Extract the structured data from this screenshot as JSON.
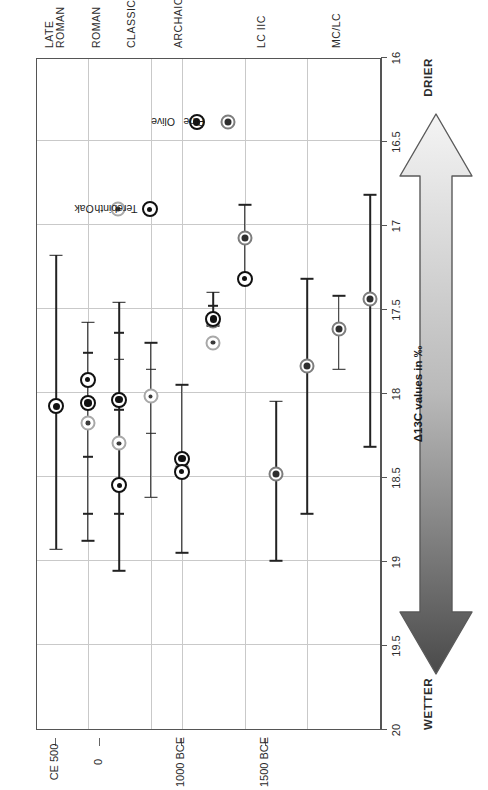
{
  "figure": {
    "orientation": "rotated-90-ccw",
    "background": "#ffffff"
  },
  "moisture_arrow": {
    "left_label": "WETTER",
    "right_label": "DRIER",
    "wet_color": "#4a4a4a",
    "dry_color": "#f2f2f2",
    "stroke": "#555555"
  },
  "axes": {
    "x_title": "Δ13C values in ‰",
    "x_ticks": [
      "20",
      "19.5",
      "19",
      "18.5",
      "18",
      "17.5",
      "17",
      "16.5",
      "16"
    ],
    "x_tick_values": [
      20,
      19.5,
      19,
      18.5,
      18,
      17.5,
      17,
      16.5,
      16
    ],
    "x_min": 20,
    "x_max": 16,
    "date_labels": [
      "CE 500",
      "0",
      "1000 BCE",
      "1500 BCE"
    ],
    "period_labels": [
      "LATE ROMAN",
      "ROMAN",
      "CLASSICAL",
      "ARCHAIC",
      "LC IIC",
      "MC/LC"
    ]
  },
  "legend": {
    "items": [
      {
        "name": "Oak",
        "marker": "oak"
      },
      {
        "name": "Terebinth",
        "marker": "terebinth"
      },
      {
        "name": "Olive",
        "marker": "olive"
      },
      {
        "name": "Pine",
        "marker": "pine"
      }
    ]
  },
  "chart_data": {
    "type": "scatter",
    "title": "",
    "xlabel": "Δ13C values in ‰",
    "ylabel": "",
    "xlim": [
      20,
      16
    ],
    "x_ticks": [
      20,
      19.5,
      19,
      18.5,
      18,
      17.5,
      17,
      16.5,
      16
    ],
    "grid": true,
    "legend_position": "inside-right",
    "orientation": "horizontal-error-bars",
    "note": "Axis runs 20 (wetter) on the left to 16 (drier) on the right; each row is an archaeological period with mean marker and min/max error bar whiskers.",
    "categories": [
      "LATE ROMAN",
      "ROMAN",
      "CLASSICAL",
      "ARCHAIC",
      "LC IIC",
      "MC/LC"
    ],
    "category_dates": [
      "CE 500",
      "0",
      "",
      "1000 BCE",
      "",
      "1500 BCE"
    ],
    "series": [
      {
        "name": "Oak",
        "marker": "oak",
        "points": [
          {
            "category": "ROMAN",
            "row": 1,
            "mean": 18.18,
            "low": 18.88,
            "high": 17.58
          },
          {
            "category": "CLASSICAL",
            "row": 2,
            "mean": 18.3,
            "low": 19.06,
            "high": 17.46
          },
          {
            "category": "CLASSICAL",
            "row": 3,
            "mean": 18.02,
            "low": 18.62,
            "high": 17.7
          },
          {
            "category": "ARCHAIC",
            "row": 4,
            "mean": 18.45,
            "low": 18.95,
            "high": 17.95
          },
          {
            "category": "ARCHAIC",
            "row": 5,
            "mean": 17.7,
            "low": 17.7,
            "high": 17.7
          }
        ]
      },
      {
        "name": "Terebinth",
        "marker": "terebinth",
        "points": [
          {
            "category": "ROMAN",
            "row": 1,
            "mean": 17.92,
            "low": 18.88,
            "high": 17.58
          },
          {
            "category": "CLASSICAL",
            "row": 2,
            "mean": 18.55,
            "low": 19.06,
            "high": 17.46
          },
          {
            "category": "ARCHAIC",
            "row": 4,
            "mean": 18.47,
            "low": 18.95,
            "high": 17.95
          },
          {
            "category": "ARCHAIC",
            "row": 6,
            "mean": 17.32,
            "low": 17.32,
            "high": 16.88
          }
        ]
      },
      {
        "name": "Olive",
        "marker": "olive",
        "points": [
          {
            "category": "LATE ROMAN",
            "row": 0,
            "mean": 18.08,
            "low": 18.93,
            "high": 17.18
          },
          {
            "category": "ROMAN",
            "row": 1,
            "mean": 18.06,
            "low": 18.88,
            "high": 17.58
          },
          {
            "category": "CLASSICAL",
            "row": 2,
            "mean": 18.04,
            "low": 19.06,
            "high": 17.46
          },
          {
            "category": "ARCHAIC",
            "row": 4,
            "mean": 18.39,
            "low": 18.95,
            "high": 17.95
          },
          {
            "category": "ARCHAIC",
            "row": 5,
            "mean": 17.56,
            "low": 17.6,
            "high": 17.4
          }
        ]
      },
      {
        "name": "Pine",
        "marker": "pine",
        "points": [
          {
            "category": "ARCHAIC",
            "row": 5,
            "mean": 17.57,
            "low": 17.6,
            "high": 17.4
          },
          {
            "category": "ARCHAIC",
            "row": 6,
            "mean": 17.08,
            "low": 17.32,
            "high": 16.88
          },
          {
            "category": "LC IIC",
            "row": 7,
            "mean": 18.48,
            "low": 19.0,
            "high": 18.05
          },
          {
            "category": "LC IIC",
            "row": 8,
            "mean": 17.84,
            "low": 18.72,
            "high": 17.32
          },
          {
            "category": "MC/LC",
            "row": 9,
            "mean": 17.62,
            "low": 17.86,
            "high": 17.42
          },
          {
            "category": "MC/LC",
            "row": 10,
            "mean": 17.44,
            "low": 18.32,
            "high": 16.82
          }
        ]
      }
    ]
  }
}
